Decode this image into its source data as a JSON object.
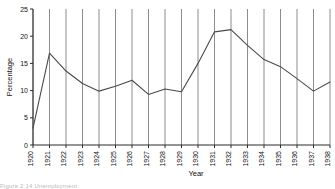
{
  "figure": {
    "caption_fragment": "Figure 2.14  Unemployment"
  },
  "chart_data": {
    "type": "line",
    "title": "",
    "subtitle": "",
    "xlabel": "Year",
    "ylabel": "Percentage",
    "categories": [
      "1920",
      "1921",
      "1922",
      "1923",
      "1924",
      "1925",
      "1926",
      "1927",
      "1928",
      "1929",
      "1930",
      "1931",
      "1932",
      "1933",
      "1934",
      "1935",
      "1936",
      "1937",
      "1938"
    ],
    "x": [
      1920,
      1921,
      1922,
      1923,
      1924,
      1925,
      1926,
      1927,
      1928,
      1929,
      1930,
      1931,
      1932,
      1933,
      1934,
      1935,
      1936,
      1937,
      1938
    ],
    "values": [
      3.1,
      16.9,
      13.6,
      11.3,
      9.9,
      10.8,
      11.9,
      9.3,
      10.3,
      9.8,
      15.0,
      20.8,
      21.2,
      18.3,
      15.7,
      14.4,
      12.2,
      9.9,
      11.6
    ],
    "series": [
      {
        "name": "Percentage unemployed",
        "values": [
          3.1,
          16.9,
          13.6,
          11.3,
          9.9,
          10.8,
          11.9,
          9.3,
          10.3,
          9.8,
          15.0,
          20.8,
          21.2,
          18.3,
          15.7,
          14.4,
          12.2,
          9.9,
          11.6
        ]
      }
    ],
    "ylim": [
      0,
      25
    ],
    "yticks": [
      0,
      5,
      10,
      15,
      20,
      25
    ],
    "ytick_labels": [
      "0",
      "5",
      "10",
      "15",
      "20",
      "25"
    ],
    "xlim": [
      "1920",
      "1938"
    ],
    "grid": "vertical-only",
    "legend": "none",
    "line_color": "#4a4a4a",
    "gridline_color": "#8c8c8c",
    "axis_color": "#2a2a2a"
  }
}
